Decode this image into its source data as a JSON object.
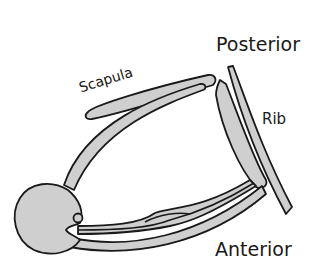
{
  "diagram": {
    "labels": {
      "posterior": "Posterior",
      "anterior": "Anterior",
      "scapula": "Scapula",
      "rib": "Rib"
    },
    "colors": {
      "bone_fill": "#cfcfcf",
      "outline": "#1a1a1a",
      "background": "#ffffff"
    }
  }
}
